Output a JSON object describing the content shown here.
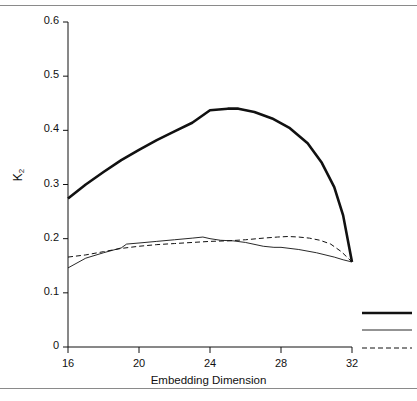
{
  "figure": {
    "width": 417,
    "height": 401,
    "background": "#ffffff",
    "rule_color": "#8a8a8a",
    "ink_color": "#111111"
  },
  "axis_titles": {
    "x": "Embedding Dimension",
    "y_main": "K",
    "y_sub": "2"
  },
  "chart_data": {
    "type": "line",
    "title": "",
    "xlabel": "Embedding Dimension",
    "ylabel": "K2",
    "xlim": [
      16,
      32
    ],
    "ylim": [
      0,
      0.6
    ],
    "xticks": [
      16,
      20,
      24,
      28,
      32
    ],
    "xtick_labels": [
      "16",
      "20",
      "24",
      "28",
      "32"
    ],
    "yticks": [
      0,
      0.1,
      0.2,
      0.3,
      0.4,
      0.5,
      0.6
    ],
    "ytick_labels": [
      "0",
      "0.1",
      "0.2",
      "0.3",
      "0.4",
      "0.5",
      "0.6"
    ],
    "grid": false,
    "legend_position": "lower-right-outside",
    "series": [
      {
        "name": "series-1",
        "style": "thick-solid",
        "color": "#111111",
        "linewidth": 2.6,
        "dash": "none",
        "x": [
          16,
          17,
          18,
          19,
          20,
          21,
          22,
          23,
          24,
          25,
          25.6,
          26.5,
          27.5,
          28.5,
          29.5,
          30.3,
          31,
          31.5,
          32
        ],
        "y": [
          0.274,
          0.3,
          0.323,
          0.345,
          0.364,
          0.382,
          0.398,
          0.414,
          0.437,
          0.44,
          0.44,
          0.434,
          0.422,
          0.404,
          0.376,
          0.34,
          0.295,
          0.243,
          0.157
        ]
      },
      {
        "name": "series-2",
        "style": "thin-solid",
        "color": "#111111",
        "linewidth": 0.9,
        "dash": "none",
        "x": [
          16,
          17,
          18,
          19,
          19.3,
          20,
          21,
          22,
          23,
          23.6,
          24,
          24.6,
          25.3,
          26,
          27,
          27.6,
          28,
          29,
          30,
          31,
          31.5,
          32
        ],
        "y": [
          0.146,
          0.164,
          0.174,
          0.183,
          0.19,
          0.192,
          0.195,
          0.198,
          0.201,
          0.203,
          0.2,
          0.197,
          0.196,
          0.193,
          0.186,
          0.184,
          0.184,
          0.18,
          0.174,
          0.166,
          0.161,
          0.157
        ]
      },
      {
        "name": "series-3",
        "style": "dashed",
        "color": "#111111",
        "linewidth": 1.0,
        "dash": "5,3",
        "x": [
          16,
          17,
          18,
          19,
          20,
          21,
          22,
          23,
          24,
          25,
          26,
          27,
          27.8,
          28.4,
          29,
          29.6,
          30.2,
          30.8,
          31.4,
          32
        ],
        "y": [
          0.166,
          0.17,
          0.176,
          0.182,
          0.186,
          0.189,
          0.191,
          0.193,
          0.195,
          0.196,
          0.198,
          0.201,
          0.203,
          0.204,
          0.203,
          0.201,
          0.197,
          0.19,
          0.176,
          0.157
        ]
      }
    ],
    "legend_keys": [
      {
        "style": "thick-solid",
        "label": ""
      },
      {
        "style": "thin-solid",
        "label": ""
      },
      {
        "style": "dashed",
        "label": ""
      }
    ]
  }
}
